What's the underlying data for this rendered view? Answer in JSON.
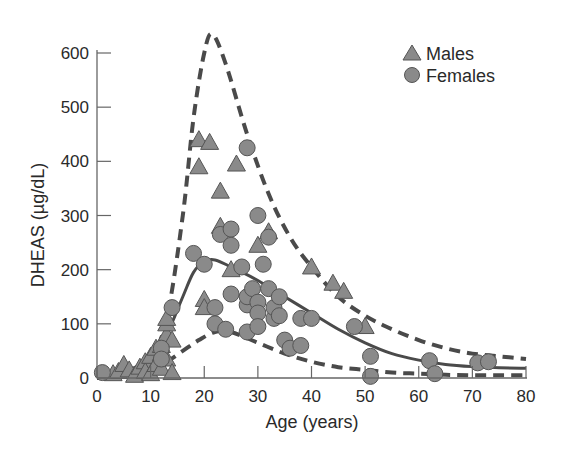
{
  "chart_data": {
    "type": "scatter",
    "title": "",
    "xlabel": "Age (years)",
    "ylabel": "DHEAS (µg/dL)",
    "xlim": [
      0,
      80
    ],
    "ylim": [
      0,
      600
    ],
    "xticks": [
      0,
      10,
      20,
      30,
      40,
      50,
      60,
      70,
      80
    ],
    "yticks": [
      0,
      100,
      200,
      300,
      400,
      500,
      600
    ],
    "grid": false,
    "legend_position": "top-right",
    "legend": [
      {
        "label": "Males",
        "marker": "triangle"
      },
      {
        "label": "Females",
        "marker": "circle"
      }
    ],
    "colors": {
      "marker_fill": "#8a8a8a",
      "marker_edge": "#555555",
      "line": "#4a4a4a",
      "axis": "#666666",
      "text": "#2a2a2a"
    },
    "series": [
      {
        "name": "Males",
        "marker": "triangle",
        "points": [
          [
            3,
            8
          ],
          [
            4,
            12
          ],
          [
            5,
            25
          ],
          [
            6,
            15
          ],
          [
            7,
            5
          ],
          [
            8,
            20
          ],
          [
            9,
            30
          ],
          [
            9,
            12
          ],
          [
            10,
            40
          ],
          [
            10,
            8
          ],
          [
            11,
            55
          ],
          [
            11,
            25
          ],
          [
            12,
            45
          ],
          [
            12,
            18
          ],
          [
            12,
            60
          ],
          [
            13,
            80
          ],
          [
            13,
            100
          ],
          [
            13,
            110
          ],
          [
            13,
            35
          ],
          [
            14,
            70
          ],
          [
            14,
            10
          ],
          [
            19,
            440
          ],
          [
            19,
            390
          ],
          [
            21,
            435
          ],
          [
            20,
            145
          ],
          [
            20,
            130
          ],
          [
            23,
            345
          ],
          [
            23,
            280
          ],
          [
            25,
            200
          ],
          [
            26,
            395
          ],
          [
            30,
            245
          ],
          [
            32,
            270
          ],
          [
            40,
            205
          ],
          [
            44,
            175
          ],
          [
            46,
            160
          ],
          [
            50,
            95
          ]
        ]
      },
      {
        "name": "Females",
        "marker": "circle",
        "points": [
          [
            1,
            10
          ],
          [
            12,
            55
          ],
          [
            12,
            35
          ],
          [
            14,
            130
          ],
          [
            18,
            230
          ],
          [
            20,
            210
          ],
          [
            22,
            130
          ],
          [
            22,
            100
          ],
          [
            23,
            265
          ],
          [
            24,
            90
          ],
          [
            25,
            155
          ],
          [
            25,
            275
          ],
          [
            25,
            245
          ],
          [
            27,
            205
          ],
          [
            28,
            425
          ],
          [
            28,
            135
          ],
          [
            28,
            150
          ],
          [
            28,
            85
          ],
          [
            29,
            165
          ],
          [
            30,
            140
          ],
          [
            30,
            120
          ],
          [
            30,
            95
          ],
          [
            30,
            300
          ],
          [
            31,
            210
          ],
          [
            32,
            260
          ],
          [
            32,
            165
          ],
          [
            33,
            110
          ],
          [
            33,
            130
          ],
          [
            34,
            150
          ],
          [
            34,
            115
          ],
          [
            35,
            70
          ],
          [
            36,
            55
          ],
          [
            38,
            110
          ],
          [
            38,
            60
          ],
          [
            40,
            110
          ],
          [
            48,
            95
          ],
          [
            51,
            40
          ],
          [
            51,
            3
          ],
          [
            62,
            32
          ],
          [
            63,
            8
          ],
          [
            71,
            28
          ],
          [
            73,
            30
          ]
        ]
      }
    ],
    "curves": [
      {
        "name": "Upper bound",
        "style": "dashed",
        "points": [
          [
            0,
            0
          ],
          [
            5,
            10
          ],
          [
            10,
            40
          ],
          [
            13,
            110
          ],
          [
            16,
            300
          ],
          [
            18,
            480
          ],
          [
            20,
            600
          ],
          [
            21.5,
            635
          ],
          [
            24,
            580
          ],
          [
            28,
            450
          ],
          [
            32,
            340
          ],
          [
            36,
            260
          ],
          [
            40,
            205
          ],
          [
            45,
            150
          ],
          [
            50,
            115
          ],
          [
            55,
            90
          ],
          [
            60,
            70
          ],
          [
            65,
            55
          ],
          [
            70,
            45
          ],
          [
            75,
            40
          ],
          [
            80,
            35
          ]
        ]
      },
      {
        "name": "Mean",
        "style": "solid",
        "points": [
          [
            0,
            0
          ],
          [
            5,
            8
          ],
          [
            10,
            30
          ],
          [
            13,
            80
          ],
          [
            16,
            150
          ],
          [
            18,
            195
          ],
          [
            20,
            215
          ],
          [
            22,
            218
          ],
          [
            25,
            205
          ],
          [
            30,
            180
          ],
          [
            35,
            150
          ],
          [
            40,
            120
          ],
          [
            45,
            90
          ],
          [
            50,
            65
          ],
          [
            55,
            45
          ],
          [
            60,
            33
          ],
          [
            65,
            25
          ],
          [
            70,
            21
          ],
          [
            75,
            19
          ],
          [
            80,
            18
          ]
        ]
      },
      {
        "name": "Lower bound",
        "style": "dashed",
        "points": [
          [
            0,
            0
          ],
          [
            5,
            4
          ],
          [
            10,
            15
          ],
          [
            13,
            30
          ],
          [
            16,
            50
          ],
          [
            19,
            70
          ],
          [
            22,
            85
          ],
          [
            25,
            85
          ],
          [
            30,
            65
          ],
          [
            35,
            45
          ],
          [
            40,
            30
          ],
          [
            45,
            20
          ],
          [
            50,
            15
          ],
          [
            55,
            10
          ],
          [
            60,
            8
          ],
          [
            65,
            6
          ],
          [
            70,
            5
          ],
          [
            75,
            5
          ],
          [
            80,
            5
          ]
        ]
      }
    ]
  },
  "legend": {
    "males": "Males",
    "females": "Females"
  },
  "axes": {
    "xlabel": "Age (years)",
    "ylabel": "DHEAS (µg/dL)",
    "xtick_labels": [
      "0",
      "10",
      "20",
      "30",
      "40",
      "50",
      "60",
      "70",
      "80"
    ],
    "ytick_labels": [
      "0",
      "100",
      "200",
      "300",
      "400",
      "500",
      "600"
    ]
  }
}
